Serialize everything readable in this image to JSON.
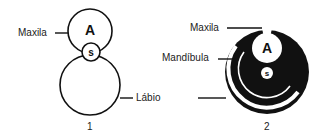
{
  "figure1": {
    "labels": {
      "maxila": "Maxila",
      "labio": "Lábio"
    },
    "glyphs": {
      "upper": "A",
      "small": "s"
    },
    "caption": "1"
  },
  "figure2": {
    "labels": {
      "maxila": "Maxila",
      "mandibula": "Mandíbula"
    },
    "glyphs": {
      "upper": "A",
      "small": "s"
    },
    "caption": "2"
  },
  "colors": {
    "ink": "#111111",
    "paper": "#ffffff"
  }
}
